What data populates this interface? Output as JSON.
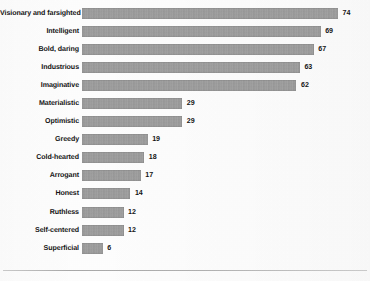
{
  "chart_data": {
    "type": "bar",
    "orientation": "horizontal",
    "title": "",
    "xlabel": "",
    "ylabel": "",
    "xlim": [
      0,
      74
    ],
    "grid": false,
    "legend": false,
    "bar_color": "#9a9a9a",
    "categories": [
      "Visionary and farsighted",
      "Intelligent",
      "Bold, daring",
      "Industrious",
      "Imaginative",
      "Materialistic",
      "Optimistic",
      "Greedy",
      "Cold-hearted",
      "Arrogant",
      "Honest",
      "Ruthless",
      "Self-centered",
      "Superficial"
    ],
    "values": [
      74,
      69,
      67,
      63,
      62,
      29,
      29,
      19,
      18,
      17,
      14,
      12,
      12,
      6
    ],
    "value_labels": [
      "74",
      "69",
      "67",
      "63",
      "62",
      "29",
      "29",
      "19",
      "18",
      "17",
      "14",
      "12",
      "12",
      "6"
    ]
  }
}
